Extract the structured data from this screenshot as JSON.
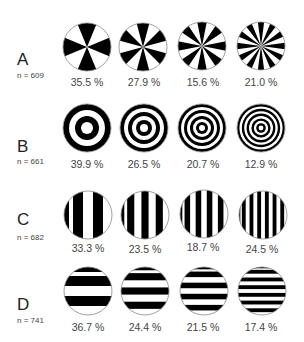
{
  "rows": [
    {
      "letter": "A",
      "n_label": "n = 609",
      "pattern": "radial-sectors",
      "stimuli": [
        {
          "sectors": 8,
          "percent": "35.5 %"
        },
        {
          "sectors": 12,
          "percent": "27.9 %"
        },
        {
          "sectors": 16,
          "percent": "15.6 %"
        },
        {
          "sectors": 24,
          "percent": "21.0 %"
        }
      ]
    },
    {
      "letter": "B",
      "n_label": "n = 661",
      "pattern": "concentric-rings",
      "stimuli": [
        {
          "rings": 2,
          "percent": "39.9 %"
        },
        {
          "rings": 3,
          "percent": "26.5 %"
        },
        {
          "rings": 4,
          "percent": "20.7 %"
        },
        {
          "rings": 5,
          "percent": "12.9 %"
        }
      ]
    },
    {
      "letter": "C",
      "n_label": "n = 682",
      "pattern": "vertical-stripes",
      "stimuli": [
        {
          "stripes": 5,
          "percent": "33.3 %"
        },
        {
          "stripes": 7,
          "percent": "23.5 %"
        },
        {
          "stripes": 9,
          "percent": "18.7 %"
        },
        {
          "stripes": 13,
          "percent": "24.5 %"
        }
      ]
    },
    {
      "letter": "D",
      "n_label": "n = 741",
      "pattern": "horizontal-stripes",
      "stimuli": [
        {
          "stripes": 5,
          "percent": "36.7 %"
        },
        {
          "stripes": 7,
          "percent": "24.4 %"
        },
        {
          "stripes": 9,
          "percent": "21.5 %"
        },
        {
          "stripes": 13,
          "percent": "17.4 %"
        }
      ]
    }
  ],
  "colors": {
    "fill": "#000000",
    "background": "#ffffff",
    "outline": "#888888",
    "text": "#444444"
  }
}
